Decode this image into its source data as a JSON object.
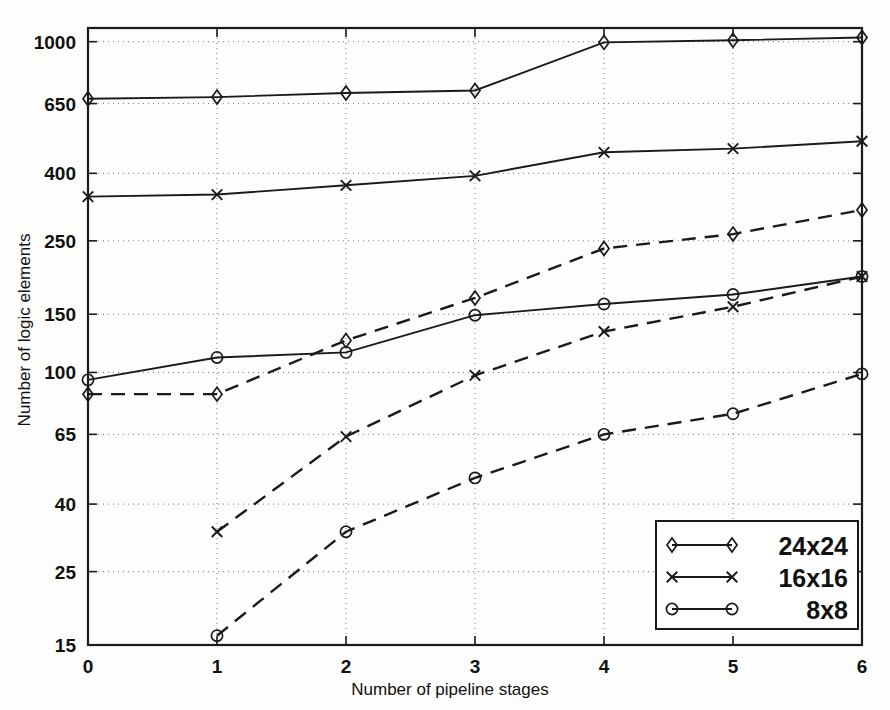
{
  "chart_data": {
    "type": "line",
    "title": "",
    "xlabel": "Number of pipeline stages",
    "ylabel": "Number of logic elements",
    "xlim": [
      0,
      6
    ],
    "ylim": [
      15,
      1100
    ],
    "yscale": "log",
    "grid": true,
    "xticks": [
      "0",
      "1",
      "2",
      "3",
      "4",
      "5",
      "6"
    ],
    "yticks": [
      "15",
      "25",
      "40",
      "65",
      "100",
      "150",
      "250",
      "400",
      "650",
      "1000"
    ],
    "ytick_values": [
      15,
      25,
      40,
      65,
      100,
      150,
      250,
      400,
      650,
      1000
    ],
    "x": [
      0,
      1,
      2,
      3,
      4,
      5,
      6
    ],
    "legend_position": "lower right",
    "series": [
      {
        "name": "24x24",
        "label": "24x24",
        "marker": "diamond",
        "linestyle": "solid",
        "color": "#1a1a1a",
        "x": [
          0,
          1,
          2,
          3,
          4,
          5,
          6
        ],
        "values": [
          672,
          680,
          700,
          712,
          995,
          1010,
          1030
        ]
      },
      {
        "name": "16x16",
        "label": "16x16",
        "marker": "x",
        "linestyle": "solid",
        "color": "#1a1a1a",
        "x": [
          0,
          1,
          2,
          3,
          4,
          5,
          6
        ],
        "values": [
          340,
          345,
          368,
          393,
          463,
          475,
          500
        ]
      },
      {
        "name": "8x8",
        "label": "8x8",
        "marker": "circle",
        "linestyle": "solid",
        "color": "#1a1a1a",
        "x": [
          0,
          1,
          2,
          3,
          4,
          5,
          6
        ],
        "values": [
          95,
          111,
          115,
          149,
          161,
          172,
          195
        ]
      },
      {
        "name": "24x24-dashed",
        "label": "24x24",
        "marker": "diamond",
        "linestyle": "dashed",
        "color": "#1a1a1a",
        "x": [
          0,
          1,
          2,
          3,
          4,
          5,
          6
        ],
        "values": [
          86,
          86,
          125,
          168,
          237,
          262,
          310
        ]
      },
      {
        "name": "16x16-dashed",
        "label": "16x16",
        "marker": "x",
        "linestyle": "dashed",
        "color": "#1a1a1a",
        "x": [
          1,
          2,
          3,
          4,
          5,
          6
        ],
        "values": [
          33,
          64,
          98,
          133,
          158,
          195
        ]
      },
      {
        "name": "8x8-dashed",
        "label": "8x8",
        "marker": "circle",
        "linestyle": "dashed",
        "color": "#1a1a1a",
        "x": [
          1,
          2,
          3,
          4,
          5,
          6
        ],
        "values": [
          16,
          33,
          48,
          65,
          75,
          99
        ]
      }
    ],
    "legend": [
      {
        "label": "24x24",
        "marker": "diamond",
        "linestyle": "solid"
      },
      {
        "label": "16x16",
        "marker": "x",
        "linestyle": "solid"
      },
      {
        "label": "8x8",
        "marker": "circle",
        "linestyle": "solid"
      }
    ]
  }
}
